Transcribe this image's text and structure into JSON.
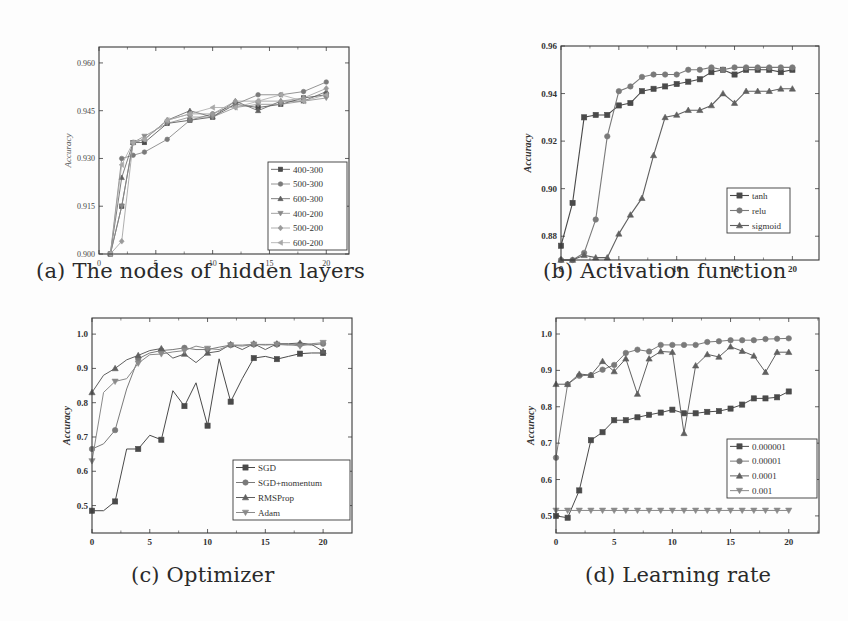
{
  "captions": {
    "a": "(a) The nodes of hidden layers",
    "b": "(b) Activation function",
    "c": "(c) Optimizer",
    "d": "(d) Learning rate"
  },
  "chart_data": [
    {
      "id": "a",
      "type": "line",
      "title": "(a) The nodes of hidden layers",
      "xlabel": "",
      "ylabel": "Accuracy",
      "xlim": [
        0,
        22
      ],
      "ylim": [
        0.9,
        0.965
      ],
      "xticks": [
        0,
        5,
        10,
        15,
        20
      ],
      "yticks": [
        0.9,
        0.915,
        0.93,
        0.945,
        0.96
      ],
      "ytick_labels": [
        "0.900",
        "0.915",
        "0.930",
        "0.945",
        "0.960"
      ],
      "legend_position": "lower right",
      "grid": false,
      "x": [
        1,
        2,
        3,
        4,
        6,
        8,
        10,
        12,
        14,
        16,
        18,
        20
      ],
      "series": [
        {
          "name": "400-300",
          "marker": "square",
          "values": [
            0.9,
            0.915,
            0.935,
            0.935,
            0.941,
            0.942,
            0.943,
            0.947,
            0.946,
            0.947,
            0.949,
            0.95
          ]
        },
        {
          "name": "500-300",
          "marker": "circle",
          "values": [
            0.9,
            0.93,
            0.931,
            0.932,
            0.936,
            0.942,
            0.944,
            0.947,
            0.95,
            0.95,
            0.951,
            0.954
          ]
        },
        {
          "name": "600-300",
          "marker": "triangle-up",
          "values": [
            0.9,
            0.924,
            0.935,
            0.936,
            0.942,
            0.945,
            0.943,
            0.948,
            0.945,
            0.948,
            0.948,
            0.951
          ]
        },
        {
          "name": "400-200",
          "marker": "triangle-down",
          "values": [
            0.9,
            0.915,
            0.935,
            0.937,
            0.941,
            0.943,
            0.943,
            0.946,
            0.947,
            0.947,
            0.948,
            0.949
          ]
        },
        {
          "name": "500-200",
          "marker": "diamond",
          "values": [
            0.9,
            0.904,
            0.935,
            0.936,
            0.942,
            0.944,
            0.944,
            0.948,
            0.948,
            0.948,
            0.949,
            0.952
          ]
        },
        {
          "name": "600-200",
          "marker": "left-triangle",
          "values": [
            0.9,
            0.928,
            0.935,
            0.936,
            0.942,
            0.944,
            0.946,
            0.946,
            0.948,
            0.95,
            0.948,
            0.95
          ]
        }
      ]
    },
    {
      "id": "b",
      "type": "line",
      "title": "(b) Activation function",
      "xlabel": "",
      "ylabel": "Accuracy",
      "xlim": [
        0,
        22.3
      ],
      "ylim": [
        0.87,
        0.96
      ],
      "xticks": [
        0,
        5,
        10,
        15,
        20
      ],
      "yticks": [
        0.88,
        0.9,
        0.92,
        0.94,
        0.96
      ],
      "ytick_labels": [
        "0.88",
        "0.90",
        "0.92",
        "0.94",
        "0.96"
      ],
      "legend_position": "lower right",
      "grid": false,
      "x": [
        0,
        1,
        2,
        3,
        4,
        5,
        6,
        7,
        8,
        9,
        10,
        11,
        12,
        13,
        14,
        15,
        16,
        17,
        18,
        19,
        20
      ],
      "series": [
        {
          "name": "tanh",
          "marker": "square",
          "values": [
            0.876,
            0.894,
            0.93,
            0.931,
            0.931,
            0.935,
            0.936,
            0.941,
            0.942,
            0.943,
            0.944,
            0.945,
            0.946,
            0.949,
            0.95,
            0.948,
            0.95,
            0.95,
            0.95,
            0.949,
            0.95
          ]
        },
        {
          "name": "relu",
          "marker": "circle",
          "values": [
            0.866,
            0.869,
            0.873,
            0.887,
            0.922,
            0.941,
            0.943,
            0.947,
            0.948,
            0.948,
            0.948,
            0.95,
            0.95,
            0.951,
            0.95,
            0.951,
            0.951,
            0.951,
            0.951,
            0.951,
            0.951
          ]
        },
        {
          "name": "sigmoid",
          "marker": "triangle-up",
          "values": [
            0.866,
            0.87,
            0.872,
            0.871,
            0.871,
            0.881,
            0.889,
            0.896,
            0.914,
            0.93,
            0.931,
            0.933,
            0.933,
            0.935,
            0.94,
            0.936,
            0.941,
            0.941,
            0.941,
            0.942,
            0.942
          ]
        }
      ]
    },
    {
      "id": "c",
      "type": "line",
      "title": "(c) Optimizer",
      "xlabel": "",
      "ylabel": "Accuracy",
      "xlim": [
        0,
        22.5
      ],
      "ylim": [
        0.42,
        1.047
      ],
      "xticks": [
        0,
        5,
        10,
        15,
        20
      ],
      "yticks": [
        0.5,
        0.6,
        0.7,
        0.8,
        0.9,
        1.0
      ],
      "ytick_labels": [
        "0.5",
        "0.6",
        "0.7",
        "0.8",
        "0.9",
        "1.0"
      ],
      "legend_position": "lower right",
      "grid": false,
      "x": [
        0,
        1,
        2,
        3,
        4,
        5,
        6,
        7,
        8,
        9,
        10,
        11,
        12,
        13,
        14,
        15,
        16,
        17,
        18,
        19,
        20
      ],
      "series": [
        {
          "name": "SGD",
          "marker": "square",
          "values": [
            0.485,
            0.485,
            0.512,
            0.665,
            0.665,
            0.705,
            0.692,
            0.835,
            0.79,
            0.858,
            0.733,
            0.928,
            0.803,
            0.87,
            0.93,
            0.935,
            0.927,
            0.935,
            0.943,
            0.945,
            0.945
          ]
        },
        {
          "name": "SGD+momentum",
          "marker": "circle",
          "values": [
            0.665,
            0.68,
            0.72,
            0.84,
            0.928,
            0.945,
            0.952,
            0.955,
            0.96,
            0.955,
            0.955,
            0.962,
            0.968,
            0.968,
            0.97,
            0.97,
            0.97,
            0.968,
            0.97,
            0.968,
            0.972
          ]
        },
        {
          "name": "RMSProp",
          "marker": "triangle-up",
          "values": [
            0.83,
            0.88,
            0.9,
            0.925,
            0.938,
            0.952,
            0.958,
            0.93,
            0.942,
            0.917,
            0.945,
            0.95,
            0.97,
            0.955,
            0.972,
            0.955,
            0.972,
            0.972,
            0.974,
            0.97,
            0.95
          ]
        },
        {
          "name": "Adam",
          "marker": "triangle-down",
          "values": [
            0.63,
            0.83,
            0.862,
            0.87,
            0.915,
            0.94,
            0.942,
            0.948,
            0.952,
            0.965,
            0.958,
            0.955,
            0.968,
            0.965,
            0.97,
            0.968,
            0.97,
            0.97,
            0.965,
            0.972,
            0.975
          ]
        }
      ]
    },
    {
      "id": "d",
      "type": "line",
      "title": "(d) Learning rate",
      "xlabel": "",
      "ylabel": "Accuracy",
      "xlim": [
        0,
        22.6
      ],
      "ylim": [
        0.453,
        1.044
      ],
      "xticks": [
        0,
        5,
        10,
        15,
        20
      ],
      "yticks": [
        0.5,
        0.6,
        0.7,
        0.8,
        0.9,
        1.0
      ],
      "ytick_labels": [
        "0.5",
        "0.6",
        "0.7",
        "0.8",
        "0.9",
        "1.0"
      ],
      "legend_position": "center right",
      "grid": false,
      "x": [
        0,
        1,
        2,
        3,
        4,
        5,
        6,
        7,
        8,
        9,
        10,
        11,
        12,
        13,
        14,
        15,
        16,
        17,
        18,
        19,
        20
      ],
      "series": [
        {
          "name": "0.000001",
          "marker": "square",
          "values": [
            0.5,
            0.495,
            0.57,
            0.708,
            0.73,
            0.763,
            0.763,
            0.771,
            0.778,
            0.784,
            0.792,
            0.782,
            0.782,
            0.786,
            0.788,
            0.795,
            0.806,
            0.823,
            0.823,
            0.826,
            0.842
          ]
        },
        {
          "name": "0.00001",
          "marker": "circle",
          "values": [
            0.66,
            0.862,
            0.885,
            0.887,
            0.902,
            0.915,
            0.948,
            0.957,
            0.952,
            0.97,
            0.97,
            0.97,
            0.97,
            0.978,
            0.98,
            0.983,
            0.983,
            0.983,
            0.986,
            0.987,
            0.988
          ]
        },
        {
          "name": "0.0001",
          "marker": "triangle-up",
          "values": [
            0.862,
            0.862,
            0.89,
            0.887,
            0.925,
            0.897,
            0.932,
            0.835,
            0.932,
            0.952,
            0.95,
            0.727,
            0.913,
            0.944,
            0.937,
            0.965,
            0.953,
            0.94,
            0.895,
            0.95,
            0.95
          ]
        },
        {
          "name": "0.001",
          "marker": "triangle-down",
          "values": [
            0.515,
            0.515,
            0.515,
            0.515,
            0.515,
            0.515,
            0.515,
            0.515,
            0.515,
            0.515,
            0.515,
            0.515,
            0.515,
            0.515,
            0.515,
            0.515,
            0.515,
            0.515,
            0.515,
            0.515,
            0.515
          ]
        }
      ]
    }
  ],
  "layout": {
    "a": {
      "left": 99,
      "top": 47,
      "right": 349,
      "bottom": 254,
      "legend": {
        "x": 268,
        "y": 162,
        "w": 79,
        "h": 88
      }
    },
    "b": {
      "left": 561,
      "top": 46,
      "right": 819,
      "bottom": 260,
      "legend": {
        "x": 727,
        "y": 188,
        "w": 63,
        "h": 45
      }
    },
    "c": {
      "left": 92,
      "top": 318,
      "right": 352,
      "bottom": 533,
      "legend": {
        "x": 233,
        "y": 460,
        "w": 117,
        "h": 60
      }
    },
    "d": {
      "left": 556,
      "top": 318,
      "right": 819,
      "bottom": 533,
      "legend": {
        "x": 727,
        "y": 439,
        "w": 90,
        "h": 59
      }
    }
  },
  "colors": {
    "frame": "#3a3a3a",
    "series_dark": "#555555",
    "series_mid": "#777777",
    "series_light": "#999999"
  }
}
